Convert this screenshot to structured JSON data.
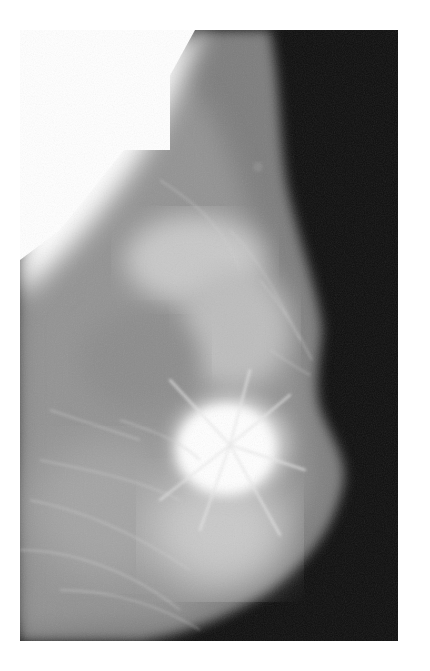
{
  "image": {
    "kind": "mammogram",
    "description": "Grayscale X-ray mammogram showing breast tissue with a dense, bright, spiculated mass near lower center-right against a dark background",
    "colors": {
      "page_background": "#ffffff",
      "film_background": "#0d0d0d",
      "tissue_gray": "#8a8a8a",
      "dense_tissue": "#f4f4f4"
    }
  }
}
